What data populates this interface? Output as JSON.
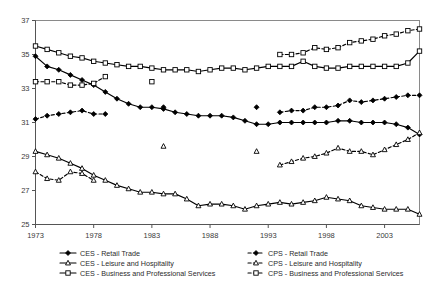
{
  "chart_data": {
    "type": "line",
    "title": "",
    "subtitle": "",
    "xlabel": "",
    "ylabel": "",
    "xlim": [
      1973,
      2006
    ],
    "ylim": [
      25,
      37
    ],
    "y_ticks": [
      25,
      27,
      29,
      31,
      33,
      35,
      37
    ],
    "x_ticks": [
      1973,
      1978,
      1983,
      1988,
      1993,
      1998,
      2003
    ],
    "x_tick_labels": [
      "1973",
      "1978",
      "1983",
      "1988",
      "1993",
      "1998",
      "2003"
    ],
    "y_tick_labels": [
      "25",
      "27",
      "29",
      "31",
      "33",
      "35",
      "37"
    ],
    "grid": false,
    "legend_position": "bottom",
    "legend_columns": 2,
    "series": [
      {
        "name": "CES - Retail Trade",
        "marker": "filled-diamond",
        "line_style": "solid",
        "color": "#000000",
        "x": [
          1973,
          1974,
          1975,
          1976,
          1977,
          1978,
          1979,
          1980,
          1981,
          1982,
          1983,
          1984,
          1985,
          1986,
          1987,
          1988,
          1989,
          1990,
          1991,
          1992,
          1993,
          1994,
          1995,
          1996,
          1997,
          1998,
          1999,
          2000,
          2001,
          2002,
          2003,
          2004,
          2005,
          2006
        ],
        "values": [
          34.9,
          34.3,
          34.1,
          33.8,
          33.5,
          33.2,
          32.8,
          32.4,
          32.1,
          31.9,
          31.9,
          31.8,
          31.6,
          31.5,
          31.4,
          31.4,
          31.4,
          31.3,
          31.1,
          30.9,
          30.9,
          31.0,
          31.0,
          31.0,
          31.0,
          31.0,
          31.1,
          31.1,
          31.0,
          31.0,
          31.0,
          30.9,
          30.7,
          30.3
        ]
      },
      {
        "name": "CES - Leisure and Hospitality",
        "marker": "open-triangle",
        "line_style": "solid",
        "color": "#000000",
        "x": [
          1973,
          1974,
          1975,
          1976,
          1977,
          1978,
          1979,
          1980,
          1981,
          1982,
          1983,
          1984,
          1985,
          1986,
          1987,
          1988,
          1989,
          1990,
          1991,
          1992,
          1993,
          1994,
          1995,
          1996,
          1997,
          1998,
          1999,
          2000,
          2001,
          2002,
          2003,
          2004,
          2005,
          2006
        ],
        "values": [
          29.3,
          29.1,
          28.9,
          28.6,
          28.3,
          27.9,
          27.6,
          27.3,
          27.1,
          26.9,
          26.9,
          26.8,
          26.8,
          26.5,
          26.1,
          26.2,
          26.2,
          26.1,
          25.9,
          26.1,
          26.2,
          26.3,
          26.2,
          26.3,
          26.4,
          26.6,
          26.5,
          26.4,
          26.1,
          26.0,
          25.9,
          25.9,
          25.9,
          25.6
        ]
      },
      {
        "name": "CES - Business and Professional Services",
        "marker": "open-square",
        "line_style": "solid",
        "color": "#000000",
        "x": [
          1973,
          1974,
          1975,
          1976,
          1977,
          1978,
          1979,
          1980,
          1981,
          1982,
          1983,
          1984,
          1985,
          1986,
          1987,
          1988,
          1989,
          1990,
          1991,
          1992,
          1993,
          1994,
          1995,
          1996,
          1997,
          1998,
          1999,
          2000,
          2001,
          2002,
          2003,
          2004,
          2005,
          2006
        ],
        "values": [
          35.5,
          35.3,
          35.1,
          34.9,
          34.8,
          34.6,
          34.5,
          34.4,
          34.3,
          34.3,
          34.2,
          34.1,
          34.1,
          34.1,
          34.0,
          34.1,
          34.2,
          34.2,
          34.1,
          34.2,
          34.3,
          34.3,
          34.3,
          34.6,
          34.3,
          34.2,
          34.2,
          34.3,
          34.3,
          34.3,
          34.3,
          34.3,
          34.5,
          35.2
        ]
      },
      {
        "name": "CPS - Retail Trade",
        "marker": "filled-diamond",
        "line_style": "dashed",
        "color": "#000000",
        "segments": [
          {
            "x": [
              1973,
              1974,
              1975,
              1976,
              1977,
              1978,
              1979
            ],
            "values": [
              31.2,
              31.4,
              31.5,
              31.6,
              31.7,
              31.5,
              31.5
            ]
          },
          {
            "x": [
              1984
            ],
            "values": [
              31.9
            ]
          },
          {
            "x": [
              1992
            ],
            "values": [
              31.9
            ]
          },
          {
            "x": [
              1994,
              1995,
              1996,
              1997,
              1998,
              1999,
              2000,
              2001,
              2002,
              2003,
              2004,
              2005,
              2006
            ],
            "values": [
              31.6,
              31.7,
              31.7,
              31.9,
              31.9,
              32.0,
              32.3,
              32.2,
              32.3,
              32.4,
              32.5,
              32.6,
              32.6
            ]
          }
        ]
      },
      {
        "name": "CPS - Leisure and Hospitality",
        "marker": "open-triangle",
        "line_style": "dashed",
        "color": "#000000",
        "segments": [
          {
            "x": [
              1973,
              1974,
              1975,
              1976,
              1977,
              1978
            ],
            "values": [
              28.1,
              27.7,
              27.6,
              28.1,
              28.0,
              27.6
            ]
          },
          {
            "x": [
              1984
            ],
            "values": [
              29.6
            ]
          },
          {
            "x": [
              1992
            ],
            "values": [
              29.3
            ]
          },
          {
            "x": [
              1994,
              1995,
              1996,
              1997,
              1998,
              1999,
              2000,
              2001,
              2002,
              2003,
              2004,
              2005,
              2006
            ],
            "values": [
              28.5,
              28.7,
              28.9,
              29.0,
              29.2,
              29.5,
              29.3,
              29.3,
              29.1,
              29.4,
              29.7,
              30.0,
              30.4
            ]
          }
        ]
      },
      {
        "name": "CPS - Business and Professional Services",
        "marker": "open-square",
        "line_style": "dashed",
        "color": "#000000",
        "segments": [
          {
            "x": [
              1973,
              1974,
              1975,
              1976,
              1977,
              1978,
              1979
            ],
            "values": [
              33.4,
              33.4,
              33.4,
              33.2,
              33.2,
              33.3,
              33.7
            ]
          },
          {
            "x": [
              1983
            ],
            "values": [
              33.4
            ]
          },
          {
            "x": [
              1994,
              1995,
              1996,
              1997,
              1998,
              1999,
              2000,
              2001,
              2002,
              2003,
              2004,
              2005,
              2006
            ],
            "values": [
              35.0,
              35.0,
              35.1,
              35.4,
              35.3,
              35.4,
              35.7,
              35.8,
              35.9,
              36.1,
              36.2,
              36.4,
              36.5
            ]
          }
        ]
      }
    ]
  },
  "legend": {
    "entries": [
      {
        "label": "CES - Retail Trade",
        "marker": "filled-diamond",
        "line_style": "solid"
      },
      {
        "label": "CPS - Retail Trade",
        "marker": "filled-diamond",
        "line_style": "dashed"
      },
      {
        "label": "CES - Leisure and Hospitality",
        "marker": "open-triangle",
        "line_style": "solid"
      },
      {
        "label": "CPS - Leisure and Hospitality",
        "marker": "open-triangle",
        "line_style": "dashed"
      },
      {
        "label": "CES - Business and Professional Services",
        "marker": "open-square",
        "line_style": "solid"
      },
      {
        "label": "CPS - Business and Professional Services",
        "marker": "open-square",
        "line_style": "dashed"
      }
    ]
  }
}
